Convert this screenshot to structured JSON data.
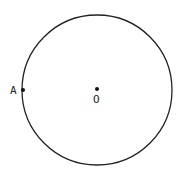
{
  "diagram": {
    "type": "geometry",
    "circle": {
      "cx": 97,
      "cy": 90,
      "r": 75,
      "stroke": "#222222"
    },
    "points": [
      {
        "id": "A",
        "label": "A",
        "x": 23,
        "y": 90,
        "on_circle": true
      },
      {
        "id": "O",
        "label": "O",
        "x": 97,
        "y": 89,
        "is_center": true
      }
    ]
  }
}
